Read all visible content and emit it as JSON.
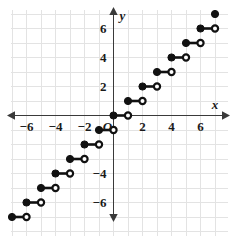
{
  "chart_data": {
    "type": "line",
    "title": "",
    "subtitle": "",
    "xlabel": "x",
    "ylabel": "y",
    "origin_label": "O",
    "xlim": [
      -7.4,
      7.6
    ],
    "ylim": [
      -7.4,
      7.4
    ],
    "grid": true,
    "grid_step": 1,
    "legend": "none",
    "function_description": "step function (greatest integer / floor function) y = floor(x)",
    "x_ticks": [
      -6,
      -4,
      -2,
      2,
      4,
      6
    ],
    "x_tick_labels": [
      "−6",
      "−4",
      "−2",
      "2",
      "4",
      "6"
    ],
    "y_ticks": [
      6,
      4,
      2,
      -4,
      -6
    ],
    "y_tick_labels": [
      "6",
      "4",
      "2",
      "−4",
      "−6"
    ],
    "endpoint_styles": {
      "left": "closed-circle",
      "right": "open-circle"
    },
    "steps": [
      {
        "x_start": -7,
        "x_end": -6,
        "y": -7,
        "left": "closed",
        "right": "open"
      },
      {
        "x_start": -6,
        "x_end": -5,
        "y": -6,
        "left": "closed",
        "right": "open"
      },
      {
        "x_start": -5,
        "x_end": -4,
        "y": -5,
        "left": "closed",
        "right": "open"
      },
      {
        "x_start": -4,
        "x_end": -3,
        "y": -4,
        "left": "closed",
        "right": "open"
      },
      {
        "x_start": -3,
        "x_end": -2,
        "y": -3,
        "left": "closed",
        "right": "open"
      },
      {
        "x_start": -2,
        "x_end": -1,
        "y": -2,
        "left": "closed",
        "right": "open"
      },
      {
        "x_start": -1,
        "x_end": 0,
        "y": -1,
        "left": "closed",
        "right": "open"
      },
      {
        "x_start": 0,
        "x_end": 1,
        "y": 0,
        "left": "closed",
        "right": "open"
      },
      {
        "x_start": 1,
        "x_end": 2,
        "y": 1,
        "left": "closed",
        "right": "open"
      },
      {
        "x_start": 2,
        "x_end": 3,
        "y": 2,
        "left": "closed",
        "right": "open"
      },
      {
        "x_start": 3,
        "x_end": 4,
        "y": 3,
        "left": "closed",
        "right": "open"
      },
      {
        "x_start": 4,
        "x_end": 5,
        "y": 4,
        "left": "closed",
        "right": "open"
      },
      {
        "x_start": 5,
        "x_end": 6,
        "y": 5,
        "left": "closed",
        "right": "open"
      },
      {
        "x_start": 6,
        "x_end": 7,
        "y": 6,
        "left": "closed",
        "right": "open"
      },
      {
        "x_start": 7,
        "x_end": 7,
        "y": 7,
        "left": "closed",
        "right": "none"
      }
    ],
    "colors": {
      "curve": "#111111",
      "axis": "#3a3a3a",
      "grid": "#e3e3e3",
      "background": "#ffffff",
      "label": "#1a1a1a"
    }
  },
  "geometry": {
    "origin_px": {
      "x": 113.5,
      "y": 115.5
    },
    "unit_px": 14.5,
    "plot_left_px": 11,
    "plot_right_px": 228,
    "plot_top_px": 10,
    "plot_bottom_px": 236
  }
}
